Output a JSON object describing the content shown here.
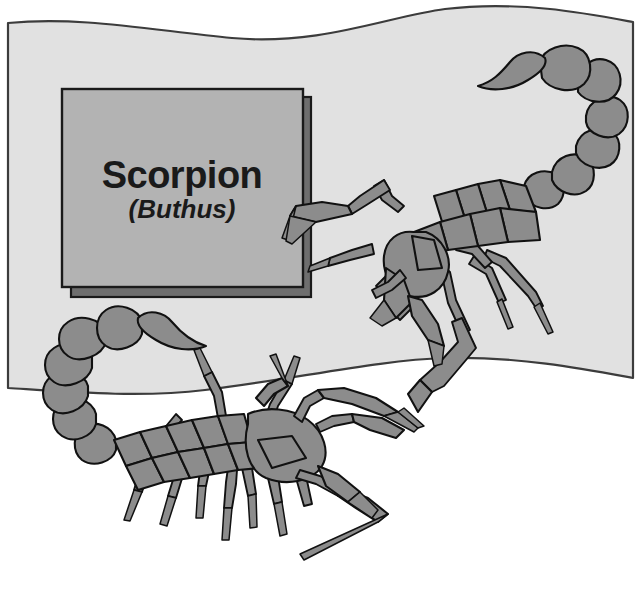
{
  "figure": {
    "kind": "scientific-illustration",
    "subject": "scorpion",
    "specimen_count": 2
  },
  "label_plaque": {
    "title": "Scorpion",
    "genus": "(Buthus)",
    "fill_color": "#b3b3b3",
    "shadow_color": "#6e6e6e",
    "border_color": "#1a1a1a"
  },
  "banner": {
    "fill_color": "#e1e1e1",
    "border_color": "#3c3c3c",
    "shape": "wavy-flag"
  },
  "specimens": [
    {
      "name": "scorpion-upper-right",
      "orientation": "facing-left",
      "body_fill": "#8c8c8c",
      "outline_color": "#111111",
      "tail_segments": 6,
      "walking_legs": 8,
      "pedipalps": 2
    },
    {
      "name": "scorpion-lower-left",
      "orientation": "facing-right",
      "body_fill": "#8c8c8c",
      "outline_color": "#111111",
      "tail_segments": 6,
      "walking_legs": 8,
      "pedipalps": 2
    }
  ],
  "canvas": {
    "background_color": "#ffffff",
    "width": 641,
    "height": 595
  }
}
